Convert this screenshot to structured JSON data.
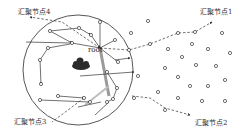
{
  "diagram": {
    "title": "",
    "labels": {
      "sink1": "汇聚节点1",
      "sink2": "汇聚节点2",
      "sink3": "汇聚节点3",
      "sink4": "汇聚节点4",
      "root": "root"
    },
    "region": {
      "cx": 78,
      "cy": 70,
      "r": 55
    },
    "colors": {
      "stroke": "#333333",
      "highlight": "#9a9a9a",
      "cloud": "#2b2b2b"
    }
  }
}
